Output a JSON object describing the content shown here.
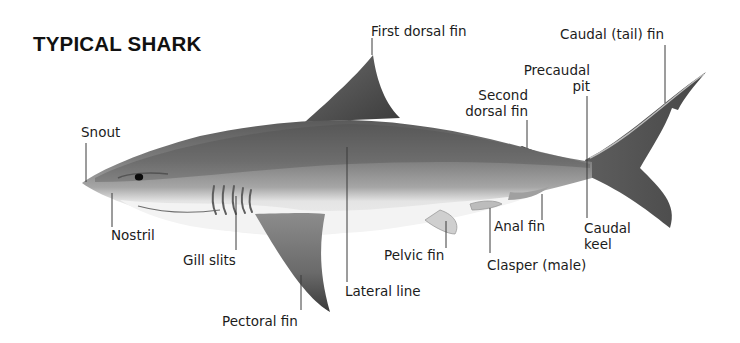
{
  "title": "TYPICAL SHARK",
  "labels": {
    "first_dorsal_fin": "First dorsal fin",
    "caudal_tail_fin": "Caudal (tail) fin",
    "precaudal_pit_line1": "Precaudal",
    "precaudal_pit_line2": "pit",
    "second_dorsal_fin_line1": "Second",
    "second_dorsal_fin_line2": "dorsal fin",
    "snout": "Snout",
    "nostril": "Nostril",
    "gill_slits": "Gill slits",
    "pectoral_fin": "Pectoral fin",
    "lateral_line": "Lateral line",
    "pelvic_fin": "Pelvic fin",
    "clasper": "Clasper (male)",
    "anal_fin": "Anal fin",
    "caudal_keel_line1": "Caudal",
    "caudal_keel_line2": "keel"
  },
  "colors": {
    "background": "#ffffff",
    "body_dark": "#4a4a4a",
    "body_mid": "#8a8a8a",
    "belly": "#ececec",
    "leader_line": "#3a3a3a",
    "text": "#1c1c1c"
  }
}
